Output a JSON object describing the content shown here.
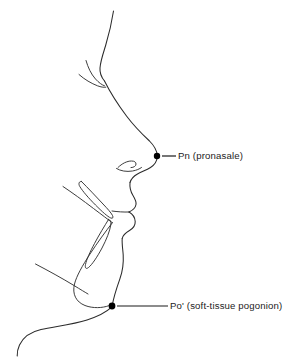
{
  "figure": {
    "type": "anatomical-line-drawing",
    "background_color": "#ffffff",
    "line_color": "#2b2b2b",
    "text_color": "#1c1c1c",
    "marker_color": "#000000",
    "width": 305,
    "height": 357
  },
  "labels": [
    {
      "id": "pn",
      "abbreviation": "Pn",
      "full_name": "(pronasale)",
      "text": "Pn (pronasale)",
      "marker_x": 157,
      "marker_y": 156,
      "leader_start_x": 162,
      "leader_end_x": 176,
      "leader_y": 156,
      "text_x": 178,
      "text_y": 151
    },
    {
      "id": "pog",
      "abbreviation": "Po'",
      "full_name": "(soft-tissue pogonion)",
      "text": "Po' (soft-tissue pogonion)",
      "marker_x": 112,
      "marker_y": 306,
      "leader_start_x": 117,
      "leader_end_x": 168,
      "leader_y": 306,
      "text_x": 170,
      "text_y": 301
    }
  ],
  "structures": [
    {
      "id": "forehead-soft-tissue",
      "name": "forehead and glabella contour"
    },
    {
      "id": "eyebrow-ridge",
      "name": "supraorbital / eyebrow line"
    },
    {
      "id": "nasal-dorsum",
      "name": "nasal dorsum to nose tip"
    },
    {
      "id": "columella-nostril",
      "name": "columella and nostril curve"
    },
    {
      "id": "upper-lip",
      "name": "upper lip profile"
    },
    {
      "id": "lower-lip",
      "name": "lower lip and labiomental sulcus"
    },
    {
      "id": "chin-soft-tissue",
      "name": "soft-tissue chin to pogonion"
    },
    {
      "id": "submental-neck",
      "name": "submental and neck contour"
    },
    {
      "id": "upper-incisor",
      "name": "upper central incisor outline"
    },
    {
      "id": "lower-incisor",
      "name": "lower central incisor outline"
    },
    {
      "id": "symphysis",
      "name": "mandibular symphysis outline"
    },
    {
      "id": "mandibular-body",
      "name": "mandibular body / inferior border"
    }
  ]
}
